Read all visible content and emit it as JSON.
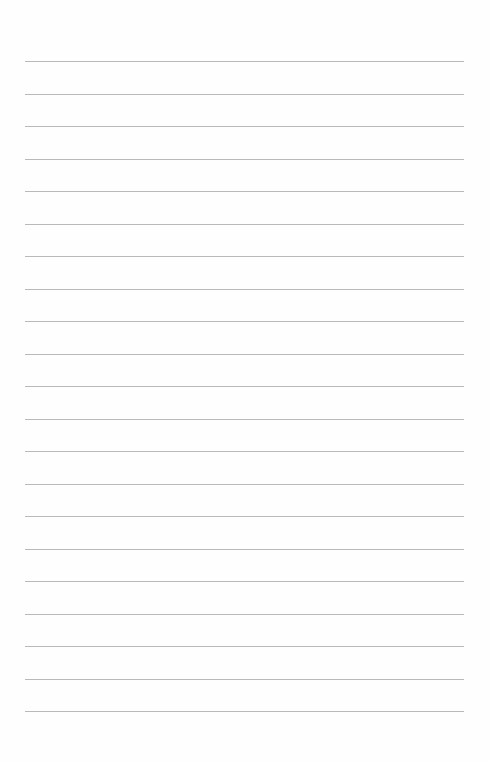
{
  "page": {
    "type": "lined-paper",
    "line_count": 21,
    "first_line_y": 61,
    "line_spacing": 32.5,
    "line_left": 25,
    "line_width": 439,
    "line_color": "#b9b9b9",
    "background_color": "#fefefe"
  }
}
